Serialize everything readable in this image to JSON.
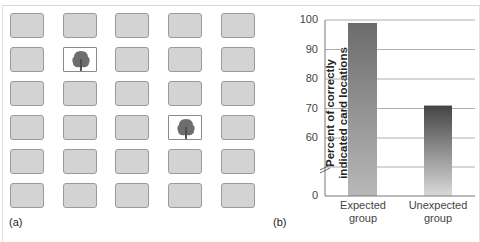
{
  "panel_a": {
    "label": "(a)",
    "grid": {
      "rows": 6,
      "cols": 5
    },
    "face_up_cards": [
      {
        "row": 1,
        "col": 1,
        "icon": "tree-icon"
      },
      {
        "row": 3,
        "col": 3,
        "icon": "tree-icon"
      }
    ],
    "colors": {
      "card_back": "#d3d3d3",
      "card_border": "#9a9a9a",
      "tree": "#6e6e6e"
    }
  },
  "panel_b": {
    "label": "(b)"
  },
  "chart_data": {
    "type": "bar",
    "title": "",
    "categories": [
      "Expected group",
      "Unexpected group"
    ],
    "category_lines": [
      [
        "Expected",
        "group"
      ],
      [
        "Unexpected",
        "group"
      ]
    ],
    "values": [
      99,
      71
    ],
    "xlabel": "",
    "ylabel": "Percent of correctly indicated card locations",
    "ylabel_lines": [
      "Percent of correctly",
      "indicated card locations"
    ],
    "yticks": [
      0,
      60,
      70,
      80,
      90,
      100
    ],
    "ylim": [
      0,
      100
    ],
    "axis_break": true,
    "grid": true,
    "legend": null,
    "bar_colors": {
      "expected_top": "#707070",
      "expected_bottom": "#b4b4b4",
      "unexpected_top": "#4a4a4a",
      "unexpected_bottom": "#d8d8d8"
    }
  }
}
